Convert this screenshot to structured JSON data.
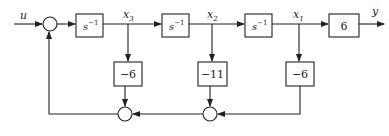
{
  "diagram": {
    "type": "state-space block diagram",
    "input_label": "u",
    "output_label": "y",
    "integrators": [
      {
        "id": "int1",
        "base": "s",
        "exponent": "−1",
        "output_state": "x3"
      },
      {
        "id": "int2",
        "base": "s",
        "exponent": "−1",
        "output_state": "x2"
      },
      {
        "id": "int3",
        "base": "s",
        "exponent": "−1",
        "output_state": "x1"
      }
    ],
    "state_labels": [
      {
        "var": "x",
        "sub": "3"
      },
      {
        "var": "x",
        "sub": "2"
      },
      {
        "var": "x",
        "sub": "1"
      }
    ],
    "output_gain": "6",
    "feedback_gains": [
      {
        "from": "x3",
        "value": "−6"
      },
      {
        "from": "x2",
        "value": "−11"
      },
      {
        "from": "x1",
        "value": "−6"
      }
    ],
    "summing_junctions": 3,
    "colors": {
      "stroke": "#222222",
      "background": "#ffffff"
    }
  }
}
